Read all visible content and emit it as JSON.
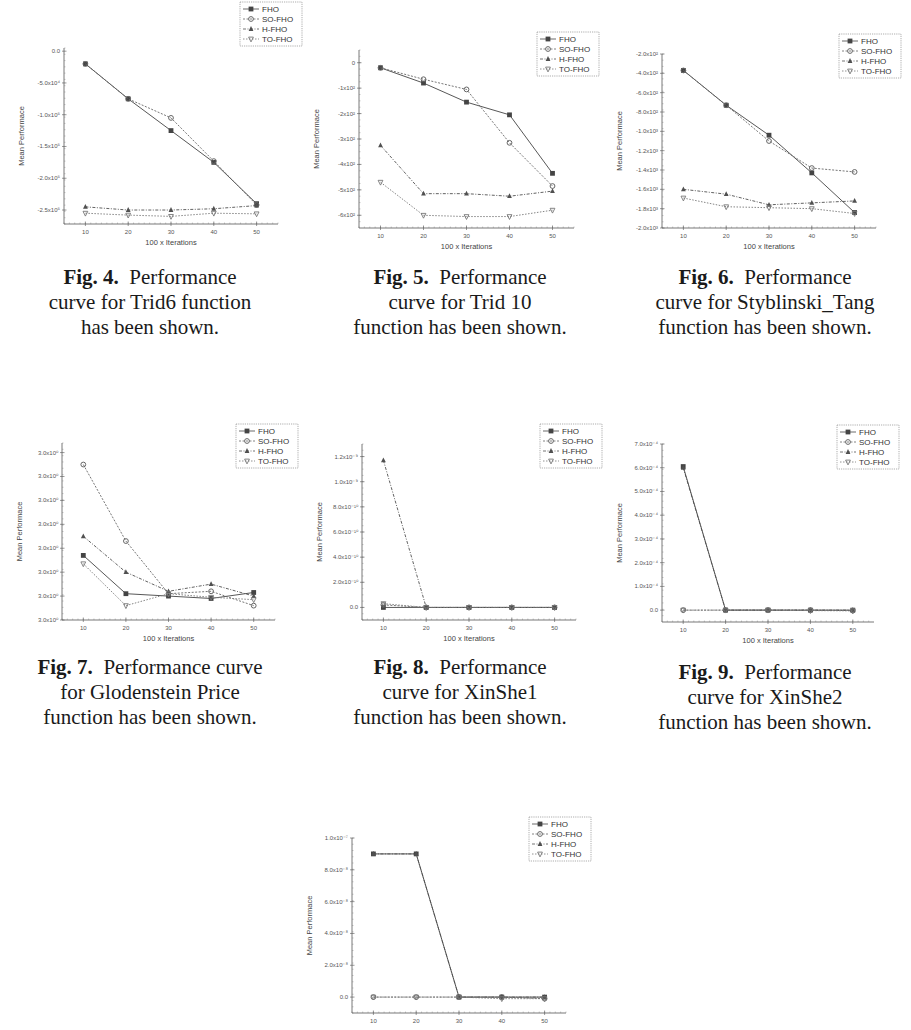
{
  "page": {
    "legend_series": [
      "FHO",
      "SO-FHO",
      "H-FHO",
      "TO-FHO"
    ],
    "series_colors": {
      "FHO": "#444444",
      "SO-FHO": "#666666",
      "H-FHO": "#505050",
      "TO-FHO": "#777777"
    }
  },
  "figures": [
    {
      "id": "fig4",
      "num": "Fig. 4.",
      "cap1": "Performance",
      "cap2": "curve for Trid6 function",
      "cap3": "has been shown."
    },
    {
      "id": "fig5",
      "num": "Fig. 5.",
      "cap1": "Performance",
      "cap2": "curve for Trid 10",
      "cap3": "function has been shown."
    },
    {
      "id": "fig6",
      "num": "Fig. 6.",
      "cap1": "Performance",
      "cap2": "curve for Styblinski_Tang",
      "cap3": "function has been shown."
    },
    {
      "id": "fig7",
      "num": "Fig. 7.",
      "cap1": "Performance curve",
      "cap2": "for Glodenstein Price",
      "cap3": "function has been shown."
    },
    {
      "id": "fig8",
      "num": "Fig. 8.",
      "cap1": "Performance",
      "cap2": "curve for XinShe1",
      "cap3": "function has been shown."
    },
    {
      "id": "fig9",
      "num": "Fig. 9.",
      "cap1": "Performance",
      "cap2": "curve for XinShe2",
      "cap3": "function has been shown."
    },
    {
      "id": "fig10",
      "num": "",
      "cap1": "",
      "cap2": "",
      "cap3": ""
    }
  ],
  "chart_data": [
    {
      "figure": "Fig. 4",
      "type": "line",
      "title": "",
      "xlabel": "100 x Iterations",
      "ylabel": "Mean Performace",
      "x": [
        10,
        20,
        30,
        40,
        50
      ],
      "xlim": [
        5,
        55
      ],
      "ylim": [
        -2.72,
        0.05
      ],
      "yticks": [
        0,
        -0.5,
        -1.0,
        -1.5,
        -2.0,
        -2.5
      ],
      "ytick_labels": [
        "0.0",
        "-5.0x10⁴",
        "-1.0x10⁵",
        "-1.5x10⁵",
        "-2.0x10⁵",
        "-2.5x10⁵"
      ],
      "legend_position": "top-right",
      "grid": false,
      "series": [
        {
          "name": "FHO",
          "values": [
            -0.2,
            -0.75,
            -1.25,
            -1.75,
            -2.4
          ]
        },
        {
          "name": "SO-FHO",
          "values": [
            -0.2,
            -0.75,
            -1.05,
            -1.73,
            -2.42
          ]
        },
        {
          "name": "H-FHO",
          "values": [
            -2.45,
            -2.5,
            -2.5,
            -2.48,
            -2.43
          ]
        },
        {
          "name": "TO-FHO",
          "values": [
            -2.55,
            -2.58,
            -2.6,
            -2.55,
            -2.56
          ]
        }
      ]
    },
    {
      "figure": "Fig. 5",
      "type": "line",
      "title": "",
      "xlabel": "100 x Iterations",
      "ylabel": "Mean Performace",
      "x": [
        10,
        20,
        30,
        40,
        50
      ],
      "xlim": [
        5,
        55
      ],
      "ylim": [
        -6.5,
        0.5
      ],
      "yticks": [
        0,
        -1,
        -2,
        -3,
        -4,
        -5,
        -6
      ],
      "ytick_labels": [
        "0",
        "-1x10²",
        "-2x10²",
        "-3x10²",
        "-4x10²",
        "-5x10²",
        "-6x10²"
      ],
      "legend_position": "top-right",
      "grid": false,
      "series": [
        {
          "name": "FHO",
          "values": [
            -0.2,
            -0.8,
            -1.55,
            -2.05,
            -4.35
          ]
        },
        {
          "name": "SO-FHO",
          "values": [
            -0.2,
            -0.65,
            -1.05,
            -3.15,
            -4.85
          ]
        },
        {
          "name": "H-FHO",
          "values": [
            -3.25,
            -5.15,
            -5.15,
            -5.25,
            -5.05
          ]
        },
        {
          "name": "TO-FHO",
          "values": [
            -4.7,
            -6.0,
            -6.05,
            -6.05,
            -5.8
          ]
        }
      ]
    },
    {
      "figure": "Fig. 6",
      "type": "line",
      "title": "",
      "xlabel": "100 x Iterations",
      "ylabel": "Mean Performace",
      "x": [
        10,
        20,
        30,
        40,
        50
      ],
      "xlim": [
        5,
        55
      ],
      "ylim": [
        -2.0,
        -0.2
      ],
      "yticks": [
        -0.2,
        -0.4,
        -0.6,
        -0.8,
        -1.0,
        -1.2,
        -1.4,
        -1.6,
        -1.8,
        -2.0
      ],
      "ytick_labels": [
        "-2.0x10²",
        "-4.0x10²",
        "-6.0x10²",
        "-8.0x10²",
        "-1.0x10³",
        "-1.2x10³",
        "-1.4x10³",
        "-1.6x10³",
        "-1.8x10³",
        "-2.0x10³"
      ],
      "legend_position": "top-right",
      "grid": false,
      "series": [
        {
          "name": "FHO",
          "values": [
            -0.37,
            -0.73,
            -1.04,
            -1.43,
            -1.84
          ]
        },
        {
          "name": "SO-FHO",
          "values": [
            -0.37,
            -0.73,
            -1.1,
            -1.38,
            -1.42
          ]
        },
        {
          "name": "H-FHO",
          "values": [
            -1.6,
            -1.65,
            -1.76,
            -1.74,
            -1.72
          ]
        },
        {
          "name": "TO-FHO",
          "values": [
            -1.69,
            -1.78,
            -1.79,
            -1.8,
            -1.85
          ]
        }
      ]
    },
    {
      "figure": "Fig. 7",
      "type": "line",
      "title": "",
      "xlabel": "100 x Iterations",
      "ylabel": "Mean Performace",
      "x": [
        10,
        20,
        30,
        40,
        50
      ],
      "xlim": [
        5,
        55
      ],
      "ylim": [
        0,
        7.4
      ],
      "yticks": [
        0,
        1,
        2,
        3,
        4,
        5,
        6,
        7
      ],
      "ytick_labels": [
        "3.0x10⁰",
        "3.0x10⁰",
        "3.0x10⁰",
        "3.0x10⁰",
        "3.0x10⁰",
        "3.0x10⁰",
        "3.0x10⁰",
        "3.0x10⁰"
      ],
      "legend_position": "top-right",
      "grid": false,
      "series": [
        {
          "name": "FHO",
          "values": [
            2.7,
            1.1,
            1.0,
            0.9,
            1.15
          ]
        },
        {
          "name": "SO-FHO",
          "values": [
            6.5,
            3.3,
            1.1,
            1.2,
            0.6
          ]
        },
        {
          "name": "H-FHO",
          "values": [
            3.5,
            2.0,
            1.2,
            1.5,
            1.0
          ]
        },
        {
          "name": "TO-FHO",
          "values": [
            2.35,
            0.6,
            1.1,
            0.95,
            0.85
          ]
        }
      ]
    },
    {
      "figure": "Fig. 8",
      "type": "line",
      "title": "",
      "xlabel": "100 x Iterations",
      "ylabel": "Mean Performace",
      "x": [
        10,
        20,
        30,
        40,
        50
      ],
      "xlim": [
        5,
        55
      ],
      "ylim": [
        -0.1,
        1.3
      ],
      "yticks": [
        0,
        0.2,
        0.4,
        0.6,
        0.8,
        1.0,
        1.2
      ],
      "ytick_labels": [
        "0.0",
        "2.0x10⁻¹⁰",
        "4.0x10⁻¹⁰",
        "6.0x10⁻¹⁰",
        "8.0x10⁻¹⁰",
        "1.0x10⁻⁹",
        "1.2x10⁻⁹"
      ],
      "legend_position": "top-right",
      "grid": false,
      "series": [
        {
          "name": "FHO",
          "values": [
            0.0,
            0.0,
            0.0,
            0.0,
            0.0
          ]
        },
        {
          "name": "SO-FHO",
          "values": [
            0.02,
            0.0,
            0.0,
            0.0,
            0.0
          ]
        },
        {
          "name": "H-FHO",
          "values": [
            1.17,
            0.0,
            0.0,
            0.0,
            0.0
          ]
        },
        {
          "name": "TO-FHO",
          "values": [
            0.03,
            0.0,
            0.0,
            0.0,
            0.0
          ]
        }
      ]
    },
    {
      "figure": "Fig. 9",
      "type": "line",
      "title": "",
      "xlabel": "100 x Iterations",
      "ylabel": "Mean Performace",
      "x": [
        10,
        20,
        30,
        40,
        50
      ],
      "xlim": [
        5,
        55
      ],
      "ylim": [
        -0.5,
        7.0
      ],
      "yticks": [
        0,
        1,
        2,
        3,
        4,
        5,
        6,
        7
      ],
      "ytick_labels": [
        "0.0",
        "1.0x10⁻⁴",
        "2.0x10⁻⁴",
        "3.0x10⁻⁴",
        "4.0x10⁻⁴",
        "5.0x10⁻⁴",
        "6.0x10⁻⁴",
        "7.0x10⁻⁴"
      ],
      "legend_position": "top-right",
      "grid": false,
      "series": [
        {
          "name": "FHO",
          "values": [
            6.05,
            0.0,
            0.0,
            0.0,
            0.0
          ]
        },
        {
          "name": "SO-FHO",
          "values": [
            0.0,
            0.0,
            0.0,
            0.0,
            -0.02
          ]
        },
        {
          "name": "H-FHO",
          "values": [
            6.0,
            0.0,
            0.0,
            0.0,
            0.0
          ]
        },
        {
          "name": "TO-FHO",
          "values": [
            0.0,
            0.0,
            0.0,
            -0.02,
            -0.03
          ]
        }
      ]
    },
    {
      "figure": "Fig. 10",
      "type": "line",
      "title": "",
      "xlabel": "",
      "ylabel": "Mean Performace",
      "x": [
        10,
        20,
        30,
        40,
        50
      ],
      "xlim": [
        5,
        55
      ],
      "ylim": [
        -0.1,
        1.0
      ],
      "yticks": [
        0,
        0.2,
        0.4,
        0.6,
        0.8,
        1.0
      ],
      "ytick_labels": [
        "0.0",
        "2.0x10⁻⁸",
        "4.0x10⁻⁸",
        "6.0x10⁻⁸",
        "8.0x10⁻⁸",
        "1.0x10⁻⁷"
      ],
      "legend_position": "top-right",
      "grid": false,
      "series": [
        {
          "name": "FHO",
          "values": [
            0.9,
            0.9,
            0.0,
            0.0,
            0.0
          ]
        },
        {
          "name": "SO-FHO",
          "values": [
            0.0,
            0.0,
            0.0,
            0.0,
            -0.01
          ]
        },
        {
          "name": "H-FHO",
          "values": [
            0.9,
            0.9,
            0.0,
            0.0,
            0.0
          ]
        },
        {
          "name": "TO-FHO",
          "values": [
            0.0,
            0.0,
            0.0,
            -0.01,
            -0.01
          ]
        }
      ]
    }
  ]
}
